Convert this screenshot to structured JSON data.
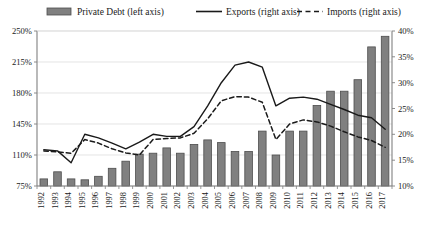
{
  "chart_data": {
    "type": "bar",
    "title": "",
    "subtitle": "",
    "xlabel": "",
    "ylabel": "",
    "y2label": "",
    "grid": true,
    "legend_position": "top",
    "categories": [
      "1992",
      "1993",
      "1994",
      "1995",
      "1996",
      "1997",
      "1998",
      "1999",
      "2000",
      "2001",
      "2002",
      "2003",
      "2004",
      "2005",
      "2006",
      "2007",
      "2008",
      "2009",
      "2010",
      "2011",
      "2012",
      "2013",
      "2014",
      "2015",
      "2016",
      "2017"
    ],
    "left_axis": {
      "name": "Private Debt (% of GDP)",
      "ticks": [
        "75%",
        "110%",
        "145%",
        "180%",
        "215%",
        "250%"
      ],
      "tick_values": [
        75,
        110,
        145,
        180,
        215,
        250
      ],
      "ylim": [
        75,
        250
      ],
      "suffix": "%"
    },
    "right_axis": {
      "name": "Trade (% of GDP)",
      "ticks": [
        "10%",
        "15%",
        "20%",
        "25%",
        "30%",
        "35%",
        "40%"
      ],
      "tick_values": [
        10,
        15,
        20,
        25,
        30,
        35,
        40
      ],
      "ylim": [
        10,
        40
      ],
      "suffix": "%"
    },
    "series": [
      {
        "name": "Private Debt (left axis)",
        "kind": "bar",
        "axis": "left",
        "color": "#808080",
        "edge_color": "#4d4d4d",
        "values": [
          83,
          91,
          83,
          82,
          86,
          95,
          103,
          111,
          112,
          118,
          112,
          122,
          127,
          124,
          114,
          114,
          137,
          110,
          137,
          137,
          166,
          182,
          182,
          195,
          232,
          244
        ]
      },
      {
        "name": "Exports (right axis)",
        "kind": "line",
        "axis": "right",
        "color": "#1a1a1a",
        "dash": "solid",
        "values": [
          17.0,
          16.8,
          14.5,
          20.0,
          19.3,
          18.3,
          17.2,
          18.5,
          20.0,
          19.6,
          19.6,
          21.5,
          25.5,
          30.0,
          33.4,
          34.0,
          33.0,
          25.5,
          27.0,
          27.2,
          26.8,
          25.8,
          24.8,
          23.7,
          23.2,
          21.0
        ]
      },
      {
        "name": "Imports (right axis)",
        "kind": "line",
        "axis": "right",
        "color": "#1a1a1a",
        "dash": "dashed",
        "values": [
          16.8,
          16.6,
          16.3,
          19.0,
          18.3,
          17.2,
          16.4,
          16.0,
          19.0,
          19.2,
          19.3,
          20.2,
          23.0,
          26.5,
          27.3,
          27.2,
          26.2,
          19.0,
          22.0,
          22.8,
          22.4,
          21.6,
          20.5,
          19.5,
          18.8,
          17.5
        ]
      }
    ]
  },
  "legend": {
    "items": [
      {
        "label": "Private Debt (left axis)",
        "marker": "bar-swatch-icon"
      },
      {
        "label": "Exports (right axis)",
        "marker": "solid-line-icon"
      },
      {
        "label": "Imports (right axis)",
        "marker": "dashed-line-icon"
      }
    ]
  },
  "colors": {
    "bar_fill": "#808080",
    "bar_edge": "#4d4d4d",
    "line": "#1a1a1a",
    "grid": "#d9d9d9",
    "axis": "#808080",
    "background": "#ffffff"
  }
}
